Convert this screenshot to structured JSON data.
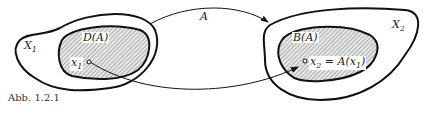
{
  "diagram": {
    "left_set": {
      "outer_label": "X",
      "outer_sub": "1",
      "inner_label": "D(A)",
      "point_label": "x",
      "point_sub": "1"
    },
    "right_set": {
      "outer_label": "X",
      "outer_sub": "2",
      "inner_label": "B(A)",
      "point_label": "x",
      "point_sub": "2",
      "point_eq": " = A(x",
      "point_eq_sub": "1",
      "point_eq_end": ")"
    },
    "mapping_label": "A",
    "caption": "Abb. 1.2.1"
  }
}
